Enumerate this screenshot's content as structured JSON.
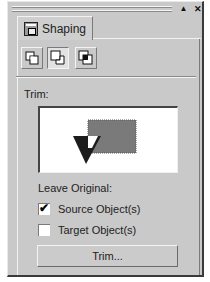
{
  "window": {
    "controls": {
      "collapse": "▲",
      "close": "✕"
    }
  },
  "tabs": [
    {
      "label": "Shaping",
      "icon": "shaping-docker-icon",
      "active": true
    }
  ],
  "shaping_modes": [
    {
      "name": "weld",
      "icon": "weld-icon",
      "active": false
    },
    {
      "name": "trim",
      "icon": "trim-icon",
      "active": true
    },
    {
      "name": "intersect",
      "icon": "intersect-icon",
      "active": false
    }
  ],
  "section": {
    "title": "Trim:",
    "preview": {
      "target_color": "#7a7a7a",
      "source_color": "#1c1c1c"
    }
  },
  "leave_original": {
    "label": "Leave Original:",
    "options": [
      {
        "label": "Source Object(s)",
        "checked": true,
        "mark": "✔"
      },
      {
        "label": "Target Object(s)",
        "checked": false,
        "mark": ""
      }
    ]
  },
  "action_button": {
    "label": "Trim..."
  }
}
